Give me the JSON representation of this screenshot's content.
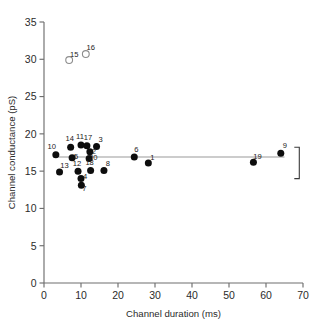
{
  "chart_data": {
    "type": "scatter",
    "title": "",
    "xlabel": "Channel duration (ms)",
    "ylabel": "Channel conductance (pS)",
    "xlim": [
      0,
      70
    ],
    "ylim": [
      0,
      35
    ],
    "xticks": [
      0,
      10,
      20,
      30,
      40,
      50,
      60,
      70
    ],
    "yticks": [
      0,
      5,
      10,
      15,
      20,
      25,
      30,
      35
    ],
    "grid": false,
    "legend": null,
    "reference_line": {
      "orientation": "horizontal",
      "y": 16.9,
      "x_start": 4.0,
      "x_end": 65.0,
      "color": "#9a9a9a"
    },
    "annotations": [
      {
        "name": "right-bracket",
        "shape": "]",
        "x": 69.0,
        "y_top": 18.2,
        "y_bottom": 14.0
      }
    ],
    "series": [
      {
        "name": "filled",
        "marker": "filled-circle",
        "color": "#0d0d0d",
        "points": [
          {
            "label": "10",
            "x": 3.2,
            "y": 17.2,
            "label_dx": -4,
            "label_dy": -6
          },
          {
            "label": "13",
            "x": 4.2,
            "y": 14.9,
            "label_dx": 5,
            "label_dy": -4
          },
          {
            "label": "14",
            "x": 7.2,
            "y": 18.2,
            "label_dx": -1,
            "label_dy": -6
          },
          {
            "label": "5",
            "x": 7.6,
            "y": 16.8,
            "label_dx": 4,
            "label_dy": 1
          },
          {
            "label": "11",
            "x": 10.0,
            "y": 18.5,
            "label_dx": -1,
            "label_dy": -6
          },
          {
            "label": "17",
            "x": 11.6,
            "y": 18.4,
            "label_dx": 1,
            "label_dy": -6
          },
          {
            "label": "2",
            "x": 12.4,
            "y": 17.6,
            "label_dx": 4,
            "label_dy": 2
          },
          {
            "label": "3",
            "x": 14.2,
            "y": 18.3,
            "label_dx": 4,
            "label_dy": -5
          },
          {
            "label": "20",
            "x": 12.2,
            "y": 16.7,
            "label_dx": 4,
            "label_dy": 2
          },
          {
            "label": "12",
            "x": 9.2,
            "y": 15.0,
            "label_dx": -1,
            "label_dy": -5
          },
          {
            "label": "4",
            "x": 10.0,
            "y": 14.0,
            "label_dx": 4,
            "label_dy": 0
          },
          {
            "label": "7",
            "x": 10.1,
            "y": 13.1,
            "label_dx": 3,
            "label_dy": 6
          },
          {
            "label": "18",
            "x": 12.6,
            "y": 15.1,
            "label_dx": -1,
            "label_dy": -5
          },
          {
            "label": "8",
            "x": 16.2,
            "y": 15.1,
            "label_dx": 4,
            "label_dy": -4
          },
          {
            "label": "6",
            "x": 24.4,
            "y": 16.9,
            "label_dx": 2,
            "label_dy": -5
          },
          {
            "label": "1",
            "x": 28.2,
            "y": 16.1,
            "label_dx": 4,
            "label_dy": -3
          },
          {
            "label": "19",
            "x": 56.6,
            "y": 16.2,
            "label_dx": 4,
            "label_dy": -3
          },
          {
            "label": "9",
            "x": 64.0,
            "y": 17.4,
            "label_dx": 4,
            "label_dy": -5
          }
        ]
      },
      {
        "name": "open",
        "marker": "open-circle",
        "color": "#ffffff",
        "points": [
          {
            "label": "15",
            "x": 6.8,
            "y": 29.9,
            "label_dx": 5,
            "label_dy": -3
          },
          {
            "label": "16",
            "x": 11.3,
            "y": 30.7,
            "label_dx": 5,
            "label_dy": -4
          }
        ]
      }
    ]
  }
}
